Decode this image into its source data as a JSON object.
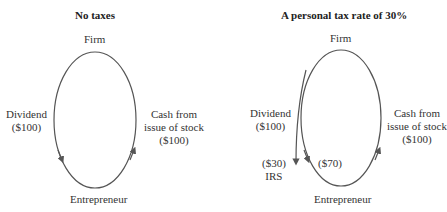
{
  "left_panel": {
    "title": "No taxes",
    "top_node": "Firm",
    "bottom_node": "Entrepreneur",
    "left_flow": {
      "line1": "Dividend",
      "line2": "($100)"
    },
    "right_flow": {
      "line1": "Cash from",
      "line2": "issue of stock",
      "line3": "($100)"
    }
  },
  "right_panel": {
    "title": "A personal tax rate of 30%",
    "top_node": "Firm",
    "bottom_node": "Entrepreneur",
    "left_flow": {
      "line1": "Dividend",
      "line2": "($100)"
    },
    "right_flow": {
      "line1": "Cash from",
      "line2": "issue of stock",
      "line3": "($100)"
    },
    "tax_branch": {
      "amount": "($30)",
      "recipient": "IRS"
    },
    "net_dividend": "($70)"
  },
  "colors": {
    "line": "#555555",
    "text": "#333333"
  }
}
